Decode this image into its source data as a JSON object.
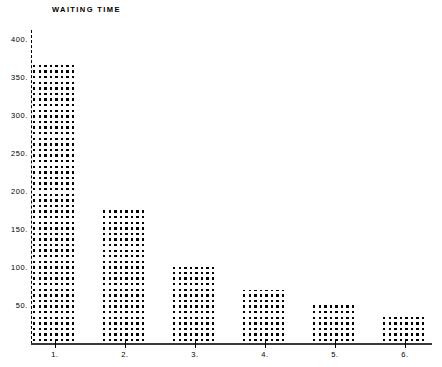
{
  "chart_data": {
    "type": "bar",
    "title": "WAITING TIME",
    "xlabel": "",
    "ylabel": "",
    "categories": [
      "1.",
      "2.",
      "3.",
      "4.",
      "5.",
      "6."
    ],
    "values": [
      370,
      175,
      100,
      70,
      55,
      35
    ],
    "ylim": [
      0,
      400
    ],
    "yticks": [
      400,
      350,
      300,
      250,
      200,
      150,
      100,
      50
    ],
    "ytick_labels": [
      "400.",
      "350.",
      "300.",
      "250.",
      "200.",
      "150.",
      "100.",
      "50."
    ],
    "xtick_labels": [
      "1.",
      "2.",
      "3.",
      "4.",
      "5.",
      "6."
    ],
    "grid": false,
    "legend": null,
    "style": "dot-matrix-ascii",
    "marker": "*",
    "colors": {
      "ink": "#000000",
      "background": "#ffffff",
      "axis": "#3a3a3a"
    }
  },
  "chart": {
    "title": "WAITING TIME"
  }
}
